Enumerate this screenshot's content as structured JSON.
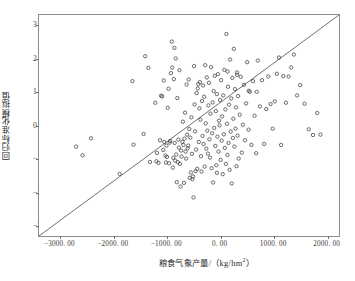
{
  "chart_data": {
    "type": "scatter",
    "title": "",
    "xlabel": "粮食气象产量/（kg/hm²）",
    "ylabel": "回归标准化模拟值",
    "xlim": [
      -3400,
      2250
    ],
    "ylim": [
      -3.35,
      3.3
    ],
    "xticks": [
      -3000,
      -2000,
      -1000,
      0,
      1000,
      2000
    ],
    "xtick_labels": [
      "-3000. 00",
      "-2000. 00",
      "-1000. 00",
      "0. 00",
      "1000. 00",
      "2000. 00"
    ],
    "yticks": [
      3,
      2,
      1,
      0,
      -1,
      -2,
      -3
    ],
    "ytick_labels": [
      "3",
      "2",
      "1",
      "0",
      "-1",
      "-2",
      "-3"
    ],
    "grid": false,
    "legend": null,
    "marker": {
      "shape": "open-circle",
      "size": 3.4,
      "edge_color": "#3b3b3b",
      "fill": "none"
    },
    "reference_line": {
      "name": "one-to-one-line",
      "color": "#4a4a4a",
      "width": 0.8,
      "x": [
        -3400,
        2250
      ],
      "y": [
        -3.35,
        3.3
      ]
    },
    "x": [
      -2700,
      -2580,
      -2420,
      -1880,
      -1640,
      -1620,
      -1430,
      -1400,
      -1340,
      -1310,
      -1210,
      -1190,
      -1180,
      -1150,
      -1120,
      -1100,
      -1080,
      -1060,
      -1050,
      -1040,
      -1020,
      -1010,
      -1000,
      -990,
      -975,
      -960,
      -950,
      -940,
      -930,
      -915,
      -900,
      -890,
      -880,
      -870,
      -860,
      -850,
      -845,
      -835,
      -825,
      -815,
      -805,
      -795,
      -785,
      -775,
      -765,
      -755,
      -745,
      -735,
      -725,
      -715,
      -700,
      -690,
      -680,
      -670,
      -660,
      -650,
      -640,
      -630,
      -620,
      -610,
      -600,
      -590,
      -580,
      -570,
      -560,
      -550,
      -540,
      -530,
      -520,
      -510,
      -500,
      -490,
      -480,
      -470,
      -460,
      -450,
      -440,
      -430,
      -420,
      -410,
      -400,
      -390,
      -380,
      -370,
      -360,
      -350,
      -340,
      -330,
      -320,
      -310,
      -300,
      -290,
      -280,
      -270,
      -260,
      -250,
      -240,
      -230,
      -220,
      -210,
      -200,
      -190,
      -180,
      -170,
      -160,
      -150,
      -140,
      -130,
      -120,
      -110,
      -100,
      -90,
      -80,
      -70,
      -60,
      -50,
      -40,
      -30,
      -20,
      -10,
      0,
      10,
      20,
      30,
      40,
      50,
      60,
      70,
      80,
      90,
      100,
      110,
      120,
      130,
      140,
      150,
      160,
      170,
      180,
      190,
      200,
      210,
      220,
      230,
      240,
      250,
      260,
      270,
      280,
      290,
      300,
      310,
      320,
      330,
      340,
      350,
      360,
      380,
      400,
      420,
      440,
      460,
      480,
      500,
      520,
      545,
      570,
      600,
      630,
      660,
      690,
      720,
      760,
      800,
      840,
      880,
      920,
      960,
      1000,
      1040,
      1080,
      1120,
      1160,
      1200,
      1250,
      1300,
      1350,
      1400,
      1460,
      1520,
      1600,
      1680,
      1760,
      1840,
      1900,
      700,
      550,
      330,
      150,
      -50
    ],
    "y": [
      -0.66,
      -0.92,
      -0.41,
      -1.48,
      1.31,
      -0.6,
      -0.28,
      2.06,
      1.71,
      -1.12,
      0.66,
      -1.1,
      -0.85,
      -1.15,
      -0.47,
      0.87,
      0.85,
      -0.76,
      1.33,
      -0.52,
      -0.93,
      -1.14,
      -0.63,
      -0.97,
      0.51,
      1.08,
      -1.16,
      -0.54,
      -0.49,
      1.55,
      2.5,
      1.72,
      -1.29,
      -1.0,
      1.37,
      2.31,
      -0.55,
      -1.08,
      1.99,
      -0.9,
      -1.73,
      0.8,
      -1.13,
      -0.45,
      -0.69,
      1.64,
      -1.18,
      -1.86,
      -0.78,
      -0.96,
      -0.52,
      0.09,
      -0.61,
      -1.75,
      -0.42,
      0.36,
      -0.81,
      -1.02,
      1.21,
      -0.3,
      -0.71,
      -0.63,
      1.36,
      -0.13,
      -1.6,
      -0.39,
      -1.44,
      0.22,
      -0.88,
      -1.64,
      -1.56,
      -2.19,
      1.76,
      0.61,
      -0.2,
      -1.4,
      -0.75,
      0.95,
      -1.33,
      1.09,
      1.22,
      -0.52,
      0.49,
      1.28,
      0.15,
      -0.95,
      -1.41,
      0.71,
      -0.34,
      1.18,
      -0.58,
      0.84,
      -1.26,
      1.79,
      0.04,
      -0.72,
      1.42,
      -0.18,
      -0.87,
      0.58,
      1.26,
      -0.44,
      -0.99,
      0.33,
      1.73,
      -1.31,
      -0.26,
      0.67,
      -1.74,
      1.01,
      -0.1,
      1.47,
      -0.64,
      0.41,
      -1.22,
      0.92,
      -0.36,
      1.52,
      -0.81,
      0.12,
      -0.02,
      0.74,
      -1.06,
      1.34,
      -0.48,
      0.25,
      -1.49,
      0.88,
      -0.29,
      1.65,
      -0.7,
      0.46,
      -1.18,
      2.73,
      0.03,
      -0.91,
      1.14,
      -0.55,
      0.6,
      -1.36,
      1.96,
      -0.21,
      0.79,
      -1.77,
      1.41,
      -0.4,
      0.18,
      2.28,
      -0.66,
      1.07,
      -0.12,
      0.52,
      -1.25,
      1.57,
      -0.33,
      0.86,
      -1.02,
      0.3,
      1.44,
      -0.84,
      0.0,
      1.2,
      -0.47,
      0.64,
      1.88,
      -0.15,
      0.99,
      -0.61,
      1.31,
      0.27,
      -0.86,
      1.93,
      0.55,
      1.34,
      -0.58,
      0.47,
      1.45,
      0.62,
      -0.12,
      0.7,
      1.53,
      2.02,
      -0.61,
      1.46,
      0.66,
      1.45,
      1.72,
      2.11,
      0.88,
      1.19,
      0.63,
      -0.14,
      -0.31,
      0.35,
      -0.3,
      0.99,
      1.02,
      1.5,
      1.6,
      -1.45
    ]
  },
  "axes": {
    "x_title": "粮食气象产量/（kg/hm",
    "x_title_sup": "2",
    "x_title_tail": "）",
    "y_title": "回归标准化模拟值"
  }
}
